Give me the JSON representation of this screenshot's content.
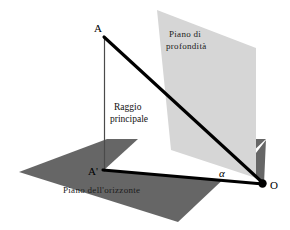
{
  "diagram": {
    "background_color": "#ffffff",
    "width": 290,
    "height": 230,
    "planes": [
      {
        "id": "depth-plane",
        "label_line1": "Piano  di",
        "label_line2": "profondità",
        "fill_color": "#d6d6d6",
        "orientation": "vertical"
      },
      {
        "id": "horizon-plane",
        "label": "Piano dell'orizzonte",
        "fill_color": "#666666",
        "orientation": "horizontal"
      }
    ],
    "points": [
      {
        "id": "A",
        "label": "A",
        "x": 104,
        "y": 36
      },
      {
        "id": "A-prime",
        "label": "A'",
        "x": 104,
        "y": 170
      },
      {
        "id": "O",
        "label": "O",
        "x": 262,
        "y": 184
      }
    ],
    "angle": {
      "id": "alpha",
      "label": "α",
      "vertex": "O"
    },
    "ray": {
      "id": "principal-ray",
      "label_line1": "Raggio",
      "label_line2": "principale",
      "from": "A",
      "to": "O",
      "color": "#000000"
    },
    "segments": [
      {
        "id": "A-to-O",
        "label": "A–O",
        "style": "thick-solid"
      },
      {
        "id": "Aprime-to-O",
        "label": "A'–O",
        "style": "thick-solid"
      },
      {
        "id": "A-to-Aprime",
        "label": "A–A'",
        "style": "thin-vertical"
      }
    ]
  }
}
